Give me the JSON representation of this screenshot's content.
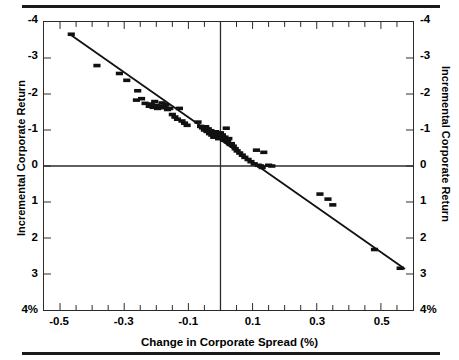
{
  "figure": {
    "x_axis_title": "Change in Corporate Spread (%)",
    "y_axis_title_left": "Incremental Corporate Return",
    "y_axis_title_right": "Incremental Corporate Return",
    "y_ticklabels": [
      "4%",
      "3",
      "2",
      "1",
      "0",
      "-1",
      "-2",
      "-3",
      "-4"
    ],
    "x_ticklabels": [
      "-0.5",
      "-0.3",
      "-0.1",
      "0.1",
      "0.3",
      "0.5"
    ],
    "marker_color": "#111111",
    "line_color": "#111111",
    "frame_color": "#2b2b2b"
  },
  "chart_data": {
    "type": "scatter",
    "title": "",
    "xlabel": "Change in Corporate Spread (%)",
    "ylabel": "Incremental Corporate Return",
    "xlim": [
      -0.55,
      0.6
    ],
    "ylim": [
      -4,
      4
    ],
    "xticks": [
      -0.5,
      -0.3,
      -0.1,
      0.1,
      0.3,
      0.5
    ],
    "xticks_minor_step": 0.05,
    "yticks": [
      -4,
      -3,
      -2,
      -1,
      0,
      1,
      2,
      3,
      4
    ],
    "grid": false,
    "legend": null,
    "zero_lines": {
      "vertical_x": 0,
      "horizontal_y": 0
    },
    "series": [
      {
        "name": "Incremental corporate return vs change in corporate spread",
        "marker": "filled-rectangle",
        "points": [
          [
            -0.465,
            3.66
          ],
          [
            -0.385,
            2.79
          ],
          [
            -0.315,
            2.57
          ],
          [
            -0.292,
            2.38
          ],
          [
            -0.258,
            2.09
          ],
          [
            -0.262,
            1.83
          ],
          [
            -0.246,
            1.87
          ],
          [
            -0.235,
            1.74
          ],
          [
            -0.222,
            1.66
          ],
          [
            -0.216,
            1.72
          ],
          [
            -0.21,
            1.63
          ],
          [
            -0.205,
            1.79
          ],
          [
            -0.2,
            1.68
          ],
          [
            -0.196,
            1.6
          ],
          [
            -0.19,
            1.66
          ],
          [
            -0.182,
            1.75
          ],
          [
            -0.176,
            1.62
          ],
          [
            -0.17,
            1.7
          ],
          [
            -0.165,
            1.57
          ],
          [
            -0.158,
            1.6
          ],
          [
            -0.15,
            1.43
          ],
          [
            -0.142,
            1.36
          ],
          [
            -0.134,
            1.3
          ],
          [
            -0.128,
            1.6
          ],
          [
            -0.12,
            1.25
          ],
          [
            -0.112,
            1.19
          ],
          [
            -0.104,
            1.13
          ],
          [
            -0.07,
            1.22
          ],
          [
            -0.062,
            1.1
          ],
          [
            -0.056,
            1.06
          ],
          [
            -0.05,
            1.0
          ],
          [
            -0.046,
            1.09
          ],
          [
            -0.042,
            0.96
          ],
          [
            -0.038,
            1.03
          ],
          [
            -0.034,
            0.9
          ],
          [
            -0.03,
            0.98
          ],
          [
            -0.027,
            0.86
          ],
          [
            -0.024,
            0.93
          ],
          [
            -0.021,
            0.8
          ],
          [
            -0.018,
            0.88
          ],
          [
            -0.015,
            0.95
          ],
          [
            -0.012,
            0.82
          ],
          [
            -0.009,
            0.9
          ],
          [
            -0.006,
            0.76
          ],
          [
            -0.003,
            0.84
          ],
          [
            0.0,
            0.92
          ],
          [
            0.003,
            0.78
          ],
          [
            0.006,
            0.86
          ],
          [
            0.01,
            0.72
          ],
          [
            0.014,
            0.8
          ],
          [
            0.018,
            1.05
          ],
          [
            0.022,
            0.68
          ],
          [
            0.026,
            0.76
          ],
          [
            0.03,
            0.6
          ],
          [
            0.034,
            0.62
          ],
          [
            0.04,
            0.55
          ],
          [
            0.046,
            0.48
          ],
          [
            0.052,
            0.42
          ],
          [
            0.06,
            0.36
          ],
          [
            0.068,
            0.3
          ],
          [
            0.076,
            0.24
          ],
          [
            0.086,
            0.18
          ],
          [
            0.095,
            0.12
          ],
          [
            0.105,
            0.06
          ],
          [
            0.118,
            0.02
          ],
          [
            0.125,
            0.0
          ],
          [
            0.13,
            -0.04
          ],
          [
            0.112,
            0.44
          ],
          [
            0.135,
            0.38
          ],
          [
            0.15,
            0.02
          ],
          [
            0.16,
            0.0
          ],
          [
            0.31,
            -0.78
          ],
          [
            0.335,
            -0.92
          ],
          [
            0.35,
            -1.08
          ],
          [
            0.48,
            -2.32
          ],
          [
            0.56,
            -2.84
          ]
        ]
      }
    ],
    "fit_line": {
      "type": "linear-regression",
      "x_start": -0.465,
      "y_start": 3.63,
      "x_end": 0.575,
      "y_end": -2.86,
      "slope": -6.24,
      "intercept": 0.73
    }
  }
}
